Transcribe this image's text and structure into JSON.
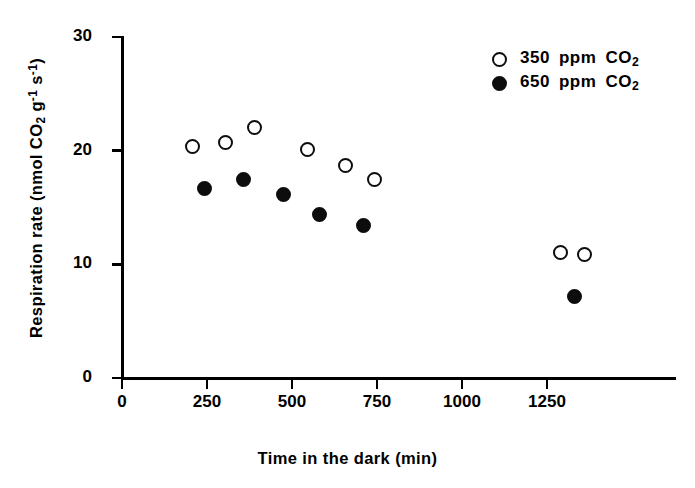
{
  "chart_data": {
    "type": "scatter",
    "title": "",
    "xlabel": "Time in the dark (min)",
    "ylabel_parts": {
      "prefix": "Respiration rate (nmol CO",
      "co2_sub": "2",
      "mid": " g",
      "g_sup": "-1",
      "mid2": " s",
      "s_sup": "-1",
      "suffix": ")"
    },
    "xlabel_plain": "Time in the dark (min)",
    "ylabel_plain": "Respiration rate (nmol CO2 g-1 s-1)",
    "xlim": [
      0,
      1450
    ],
    "ylim": [
      0,
      30
    ],
    "xticks": [
      0,
      250,
      500,
      750,
      1000,
      1250
    ],
    "xtick_labels": [
      "0",
      "250",
      "500",
      "750",
      "1000",
      "1250"
    ],
    "yticks": [
      0,
      10,
      20,
      30
    ],
    "ytick_labels": [
      "0",
      "10",
      "20",
      "30"
    ],
    "grid": false,
    "legend_position": "top-right",
    "series": [
      {
        "name": "350 ppm CO2",
        "marker": "open-circle",
        "color": "#0d0d0d",
        "fill": "#ffffff",
        "x": [
          206,
          303,
          391,
          547,
          656,
          744,
          1290,
          1360
        ],
        "y": [
          20.4,
          20.7,
          22.0,
          20.1,
          18.7,
          17.5,
          11.0,
          10.9
        ]
      },
      {
        "name": "650 ppm CO2",
        "marker": "filled-circle",
        "color": "#0d0d0d",
        "fill": "#0d0d0d",
        "x": [
          244,
          356,
          474,
          582,
          709,
          1330
        ],
        "y": [
          16.7,
          17.5,
          16.1,
          14.4,
          13.4,
          7.2
        ]
      }
    ]
  },
  "legend": {
    "entries": [
      {
        "marker": "open-circle",
        "amount": "350",
        "unit": "ppm",
        "gas": "CO",
        "gas_sub": "2"
      },
      {
        "marker": "filled-circle",
        "amount": "650",
        "unit": "ppm",
        "gas": "CO",
        "gas_sub": "2"
      }
    ]
  }
}
